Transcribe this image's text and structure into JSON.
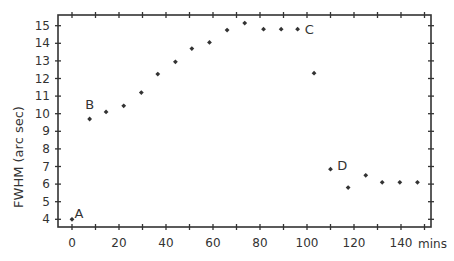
{
  "chart_data": {
    "type": "scatter",
    "title": "",
    "xlabel": "mins",
    "ylabel": "FWHM (arc sec)",
    "xlim": [
      -6,
      153
    ],
    "ylim": [
      3.55,
      15.55
    ],
    "grid": false,
    "legend": null,
    "x_ticks": [
      0,
      20,
      40,
      60,
      80,
      100,
      120,
      140
    ],
    "x_minor_ticks": [
      10,
      30,
      50,
      70,
      90,
      110,
      130,
      150
    ],
    "y_ticks": [
      4,
      5,
      6,
      7,
      8,
      9,
      10,
      11,
      12,
      13,
      14,
      15
    ],
    "series": [
      {
        "name": "FWHM",
        "marker": "diamond",
        "color": "#333333",
        "points": [
          {
            "x": 0,
            "y": 4.0
          },
          {
            "x": 7.5,
            "y": 9.7
          },
          {
            "x": 14.5,
            "y": 10.1
          },
          {
            "x": 22,
            "y": 10.45
          },
          {
            "x": 29.5,
            "y": 11.2
          },
          {
            "x": 36.5,
            "y": 12.25
          },
          {
            "x": 44,
            "y": 12.95
          },
          {
            "x": 51,
            "y": 13.7
          },
          {
            "x": 58.5,
            "y": 14.05
          },
          {
            "x": 66,
            "y": 14.75
          },
          {
            "x": 73.5,
            "y": 15.15
          },
          {
            "x": 81.5,
            "y": 14.8
          },
          {
            "x": 89,
            "y": 14.8
          },
          {
            "x": 96,
            "y": 14.8
          },
          {
            "x": 103,
            "y": 12.3
          },
          {
            "x": 110,
            "y": 6.85
          },
          {
            "x": 117.5,
            "y": 5.8
          },
          {
            "x": 125,
            "y": 6.5
          },
          {
            "x": 132,
            "y": 6.1
          },
          {
            "x": 139.5,
            "y": 6.1
          },
          {
            "x": 147,
            "y": 6.1
          }
        ]
      }
    ],
    "annotations": [
      {
        "text": "A",
        "x": 3,
        "y": 4.35
      },
      {
        "text": "B",
        "x": 7.5,
        "y": 10.55
      },
      {
        "text": "C",
        "x": 101,
        "y": 14.8
      },
      {
        "text": "D",
        "x": 115,
        "y": 7.1
      }
    ]
  }
}
